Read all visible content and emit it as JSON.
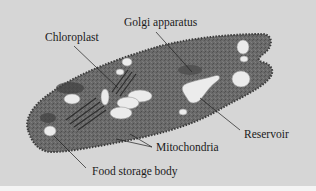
{
  "figure": {
    "background_color": "#d6d6d6",
    "cell_color": "#6e6e6e",
    "organelle_color": "#e9e9e9"
  },
  "labels": {
    "golgi": "Golgi apparatus",
    "chloroplast": "Chloroplast",
    "reservoir": "Reservoir",
    "mitochondria": "Mitochondria",
    "food_storage": "Food storage body"
  }
}
